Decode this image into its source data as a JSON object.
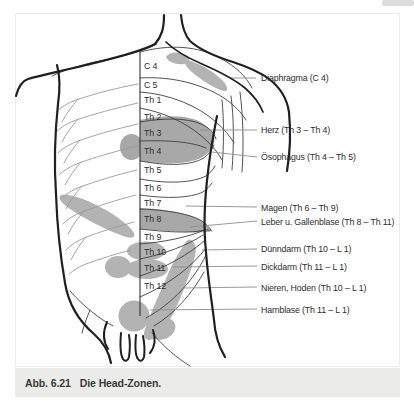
{
  "figure": {
    "caption_prefix": "Abb. 6.21",
    "caption": "Die Head-Zonen."
  },
  "spine": {
    "levels": [
      {
        "label": "C 4"
      },
      {
        "label": "C 5"
      },
      {
        "label": "Th 1"
      },
      {
        "label": "Th 2"
      },
      {
        "label": "Th 3"
      },
      {
        "label": "Th 4"
      },
      {
        "label": "Th 5"
      },
      {
        "label": "Th 6"
      },
      {
        "label": "Th 7"
      },
      {
        "label": "Th 8"
      },
      {
        "label": "Th 9"
      },
      {
        "label": "Th 10"
      },
      {
        "label": "Th 11"
      },
      {
        "label": "Th 12"
      }
    ],
    "highlighted_levels": [
      "Th 3",
      "Th 4",
      "Th 8",
      "Th 10",
      "Th 11"
    ]
  },
  "zones": {
    "labels": [
      {
        "organ": "Diaphragma",
        "segments": "C 4",
        "label": "Diaphragma (C 4)"
      },
      {
        "organ": "Herz",
        "segments": "Th 3 – Th 4",
        "label": "Herz (Th 3 – Th 4)"
      },
      {
        "organ": "Ösophagus",
        "segments": "Th 4 – Th 5",
        "label": "Ösophagus (Th 4 – Th 5)"
      },
      {
        "organ": "Magen",
        "segments": "Th 6 – Th 9",
        "label": "Magen (Th 6 – Th 9)"
      },
      {
        "organ": "Leber u. Gallenblase",
        "segments": "Th 8 – Th 11",
        "label": "Leber u. Gallenblase (Th 8 – Th 11)"
      },
      {
        "organ": "Dünndarm",
        "segments": "Th 10 – L 1",
        "label": "Dünndarm (Th 10 – L 1)"
      },
      {
        "organ": "Dickdarm",
        "segments": "Th 11 – L 1",
        "label": "Dickdarm (Th 11 – L 1)"
      },
      {
        "organ": "Nieren, Hoden",
        "segments": "Th 10 – L 1",
        "label": "Nieren, Hoden (Th 10 – L 1)"
      },
      {
        "organ": "Harnblase",
        "segments": "Th 11 – L 1",
        "label": "Harnblase (Th 11 – L 1)"
      }
    ]
  },
  "colors": {
    "zone_gray": "#b3b3b3",
    "zone_dark_gray": "#a8a8a8",
    "outline_black": "#1f1f1f",
    "thin_line": "#3f3f3f",
    "rib_gray": "#9b9b9b",
    "leader_gray": "#8f8f8f",
    "caption_bar_bg": "#ebebe9",
    "label_text": "#2d2d2d"
  }
}
